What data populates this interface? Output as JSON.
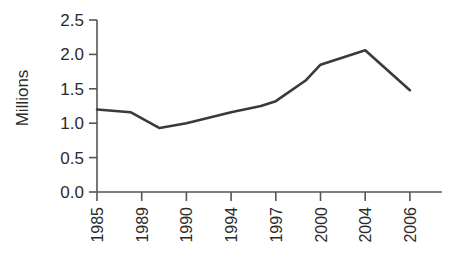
{
  "chart_data": {
    "type": "line",
    "title": "",
    "xlabel": "",
    "ylabel": "Millions",
    "ylim": [
      0.0,
      2.5
    ],
    "ytick_values": [
      0.0,
      0.5,
      1.0,
      1.5,
      2.0,
      2.5
    ],
    "ytick_labels": [
      "0.0",
      "0.5",
      "1.0",
      "1.5",
      "2.0",
      "2.5"
    ],
    "categories": [
      "1985",
      "1989",
      "1990",
      "1994",
      "1997",
      "2000",
      "2004",
      "2006"
    ],
    "x": [
      1985,
      1989,
      1990,
      1994,
      1997,
      2000,
      2004,
      2006
    ],
    "values": [
      1.2,
      1.15,
      0.93,
      1.12,
      1.32,
      1.85,
      2.06,
      1.48
    ],
    "vertices": [
      {
        "x": 1985,
        "y": 1.2
      },
      {
        "x": 1988,
        "y": 1.16
      },
      {
        "x": 1989.4,
        "y": 0.93
      },
      {
        "x": 1990,
        "y": 1.0
      },
      {
        "x": 1994,
        "y": 1.16
      },
      {
        "x": 1996,
        "y": 1.25
      },
      {
        "x": 1997,
        "y": 1.32
      },
      {
        "x": 1999,
        "y": 1.62
      },
      {
        "x": 2000,
        "y": 1.85
      },
      {
        "x": 2004,
        "y": 2.06
      },
      {
        "x": 2006,
        "y": 1.48
      }
    ],
    "grid": false,
    "legend": "none",
    "series_color": "#3a3a3a",
    "axis_color": "#555555",
    "background_color": "#ffffff"
  }
}
